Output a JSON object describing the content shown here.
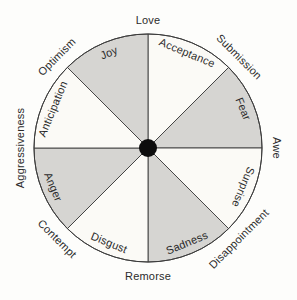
{
  "figure": {
    "description_name": "emotion-wheel",
    "wheel": {
      "sectors": [
        {
          "label": "Acceptance",
          "shaded": false
        },
        {
          "label": "Fear",
          "shaded": true
        },
        {
          "label": "Surprise",
          "shaded": false
        },
        {
          "label": "Sadness",
          "shaded": true
        },
        {
          "label": "Disgust",
          "shaded": false
        },
        {
          "label": "Anger",
          "shaded": true
        },
        {
          "label": "Anticipation",
          "shaded": false
        },
        {
          "label": "Joy",
          "shaded": true
        }
      ],
      "outer_labels": [
        {
          "label": "Love"
        },
        {
          "label": "Submission"
        },
        {
          "label": "Awe"
        },
        {
          "label": "Disappointment"
        },
        {
          "label": "Remorse"
        },
        {
          "label": "Contempt"
        },
        {
          "label": "Aggressiveness"
        },
        {
          "label": "Optimism"
        }
      ],
      "colors": {
        "shaded_fill": "#d6d5d2",
        "unshaded_fill": "#fbfaf6",
        "line": "#3c3c3c",
        "center_dot": "#0d0d0d",
        "text": "#2b2b2b",
        "background": "#fdfdfb"
      }
    }
  }
}
